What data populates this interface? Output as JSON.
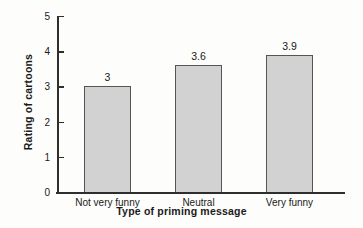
{
  "chart_data": {
    "type": "bar",
    "title": "",
    "categories": [
      "Not very funny",
      "Neutral",
      "Very funny"
    ],
    "values": [
      3,
      3.6,
      3.9
    ],
    "value_labels": [
      "3",
      "3.6",
      "3.9"
    ],
    "xlabel": "Type of priming message",
    "ylabel": "Rating of cartoons",
    "ylim": [
      0,
      5
    ],
    "yticks": [
      0,
      1,
      2,
      3,
      4,
      5
    ],
    "ytick_labels": [
      "0",
      "1",
      "2",
      "3",
      "4",
      "5"
    ],
    "grid": false,
    "legend": null,
    "bar_color": "#d2d2d2",
    "bar_edge_color": "#555555",
    "axis_color": "#2e2e2e",
    "background_color": "#fdfdfb"
  }
}
